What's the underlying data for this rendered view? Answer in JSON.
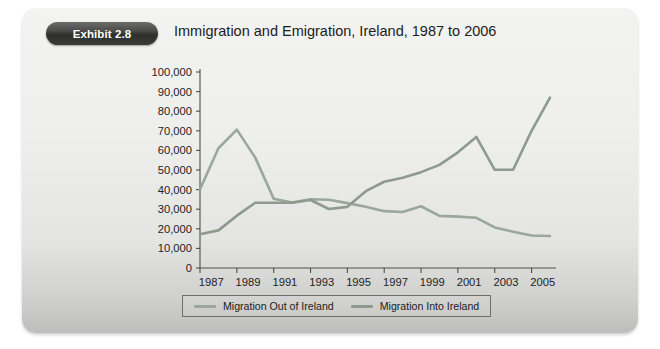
{
  "exhibit": {
    "badge_label": "Exhibit 2.8",
    "title": "Immigration and Emigration, Ireland, 1987 to 2006"
  },
  "legend": {
    "entries": [
      {
        "label": "Migration Out of Ireland",
        "color": "#9aa79a"
      },
      {
        "label": "Migration Into Ireland",
        "color": "#8d9a8d"
      }
    ]
  },
  "chart_data": {
    "type": "line",
    "title": "Immigration and Emigration, Ireland, 1987 to 2006",
    "xlabel": "",
    "ylabel": "",
    "xlim": [
      1987,
      2006
    ],
    "ylim": [
      0,
      100000
    ],
    "grid": false,
    "legend_position": "bottom",
    "x": [
      1987,
      1988,
      1989,
      1990,
      1991,
      1992,
      1993,
      1994,
      1995,
      1996,
      1997,
      1998,
      1999,
      2000,
      2001,
      2002,
      2003,
      2004,
      2005,
      2006
    ],
    "x_tick_labels": [
      "1987",
      "1989",
      "1991",
      "1993",
      "1995",
      "1997",
      "1999",
      "2001",
      "2003",
      "2005"
    ],
    "y_tick_labels": [
      "0",
      "10,000",
      "20,000",
      "30,000",
      "40,000",
      "50,000",
      "60,000",
      "70,000",
      "80,000",
      "90,000",
      "100,000"
    ],
    "y_ticks": [
      0,
      10000,
      20000,
      30000,
      40000,
      50000,
      60000,
      70000,
      80000,
      90000,
      100000
    ],
    "series": [
      {
        "name": "Migration Out of Ireland",
        "color": "#9aa79a",
        "values": [
          40200,
          61100,
          70600,
          56300,
          35300,
          33400,
          35100,
          34800,
          33100,
          31200,
          29000,
          28600,
          31500,
          26600,
          26200,
          25600,
          20700,
          18500,
          16600,
          16300
        ]
      },
      {
        "name": "Migration Into Ireland",
        "color": "#8d9a8d",
        "values": [
          17200,
          19200,
          26700,
          33300,
          33300,
          33300,
          34700,
          30100,
          31200,
          39200,
          44000,
          46000,
          48900,
          52600,
          59000,
          66900,
          50100,
          50100,
          70000,
          86900
        ]
      }
    ]
  }
}
